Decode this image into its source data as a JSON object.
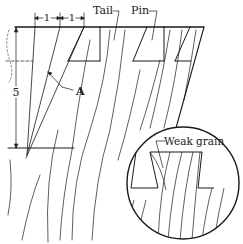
{
  "diagram": {
    "labels": {
      "tail": "Tail",
      "pin": "Pin",
      "dim_run_1": "1",
      "dim_run_2": "1",
      "dim_rise": "5",
      "point_a": "A",
      "weak_grain": "Weak grain"
    },
    "slope_ratio": "1:5",
    "colors": {
      "line": "#1a1a1a",
      "background": "#ffffff"
    }
  }
}
